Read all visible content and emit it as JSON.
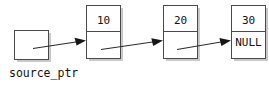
{
  "diagram": {
    "type": "linked-list",
    "title": "",
    "pointer": {
      "label": "source_ptr",
      "box": {
        "x": 14,
        "y": 30,
        "w": 34,
        "h": 29
      },
      "value": ""
    },
    "nodes": [
      {
        "id": "node-1",
        "data": "10",
        "next": "",
        "box": {
          "x": 86,
          "y": 5,
          "w": 34,
          "h": 53
        },
        "divider_y": 31
      },
      {
        "id": "node-2",
        "data": "20",
        "next": "",
        "box": {
          "x": 163,
          "y": 5,
          "w": 34,
          "h": 53
        },
        "divider_y": 31
      },
      {
        "id": "node-3",
        "data": "30",
        "next": "NULL",
        "box": {
          "x": 231,
          "y": 5,
          "w": 34,
          "h": 53
        },
        "divider_y": 31
      }
    ],
    "arrows": [
      {
        "id": "arrow-ptr-to-node1",
        "from": "source_ptr",
        "to": "node-1",
        "x1": 35,
        "y1": 48,
        "x2": 86,
        "y2": 41
      },
      {
        "id": "arrow-node1-to-node2",
        "from": "node-1",
        "to": "node-2",
        "x1": 103,
        "y1": 49,
        "x2": 163,
        "y2": 41
      },
      {
        "id": "arrow-node2-to-node3",
        "from": "node-2",
        "to": "node-3",
        "x1": 178,
        "y1": 49,
        "x2": 231,
        "y2": 41
      }
    ],
    "colors": {
      "stroke": "#4a4a4a",
      "arrow": "#161616",
      "shadow": "#c9c9c9",
      "fill": "#ffffff",
      "text": "#121212"
    }
  }
}
